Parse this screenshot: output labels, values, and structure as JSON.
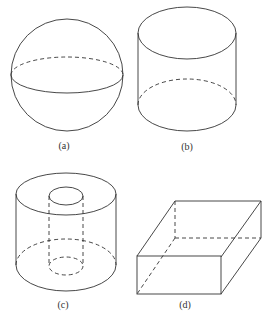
{
  "figures": [
    {
      "id": "a",
      "label": "(a)",
      "shape": "sphere"
    },
    {
      "id": "b",
      "label": "(b)",
      "shape": "cylinder"
    },
    {
      "id": "c",
      "label": "(c)",
      "shape": "hollow-cylinder"
    },
    {
      "id": "d",
      "label": "(d)",
      "shape": "rectangular-box"
    }
  ],
  "colors": {
    "stroke": "#333333",
    "background": "#ffffff"
  }
}
